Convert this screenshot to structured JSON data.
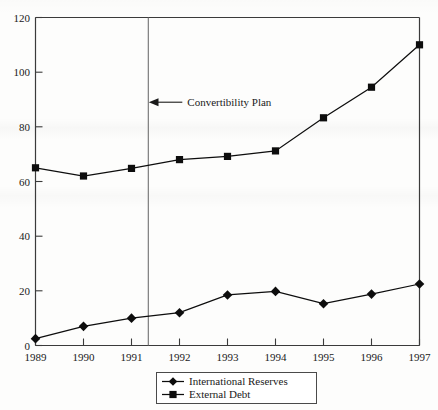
{
  "chart_data": {
    "type": "line",
    "title": "",
    "subtitle": "",
    "xlabel": "",
    "ylabel": "",
    "x": [
      1989,
      1990,
      1991,
      1992,
      1993,
      1994,
      1995,
      1996,
      1997
    ],
    "categories": [
      "1989",
      "1990",
      "1991",
      "1992",
      "1993",
      "1994",
      "1995",
      "1996",
      "1997"
    ],
    "series": [
      {
        "name": "International Reserves",
        "marker": "diamond",
        "values": [
          2.5,
          7.0,
          10.0,
          12.0,
          18.5,
          19.8,
          15.3,
          18.8,
          22.5
        ]
      },
      {
        "name": "External Debt",
        "marker": "square",
        "values": [
          65.0,
          62.0,
          64.8,
          68.0,
          69.2,
          71.2,
          83.3,
          94.5,
          110.0
        ]
      }
    ],
    "xlim": [
      1989,
      1997
    ],
    "ylim": [
      0,
      120
    ],
    "yticks": [
      0,
      20,
      40,
      60,
      80,
      100,
      120
    ],
    "ytick_labels": [
      "0",
      "20",
      "40",
      "60",
      "80",
      "100",
      "120"
    ],
    "xticks": [
      1989,
      1990,
      1991,
      1992,
      1993,
      1994,
      1995,
      1996,
      1997
    ],
    "xtick_labels": [
      "1989",
      "1990",
      "1991",
      "1992",
      "1993",
      "1994",
      "1995",
      "1996",
      "1997"
    ],
    "grid": false,
    "legend_position": "bottom-center",
    "annotations": [
      {
        "text": "Convertibility Plan",
        "type": "vertical-line-with-arrow",
        "x_value": 1991.35,
        "label_y_value": 89
      }
    ]
  },
  "legend": {
    "entries": [
      {
        "label": "International Reserves",
        "marker": "diamond-marker"
      },
      {
        "label": "External Debt",
        "marker": "square-marker"
      }
    ]
  },
  "annotation": {
    "convertibility_label": "Convertibility Plan"
  },
  "colors": {
    "line": "#0d0d0d",
    "axis": "#3b3b3b",
    "vline": "#6f6f6f",
    "background": "#fdfdfc",
    "text": "#1a1a1a"
  }
}
